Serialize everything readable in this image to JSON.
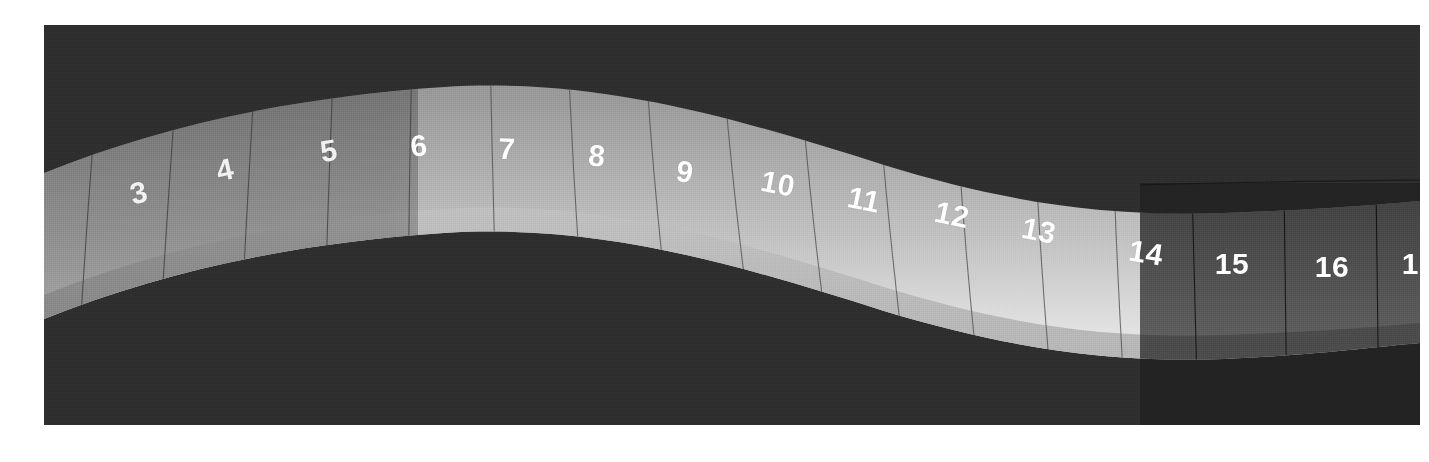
{
  "figure": {
    "background_color": "#ffffff",
    "plate_color": "#2e2e2e",
    "label_color": "#ffffff",
    "zones": [
      {
        "name": "dim-left",
        "x_start": 0,
        "x_end": 374,
        "tint": "#7e7e7e"
      },
      {
        "name": "bright-mid",
        "x_start": 374,
        "x_end": 1096,
        "tint": "#d6d6d6"
      },
      {
        "name": "dark-right",
        "x_start": 1096,
        "x_end": 1376,
        "tint": "#4a4a4a"
      }
    ]
  },
  "chart_data": {
    "type": "bar",
    "subtitle": "",
    "xlabel": "",
    "ylabel": "",
    "grid": false,
    "legend": "none",
    "categories": [
      "3",
      "4",
      "5",
      "6",
      "7",
      "8",
      "9",
      "10",
      "11",
      "12",
      "13",
      "14",
      "15",
      "16",
      "17"
    ],
    "values": [
      3,
      4,
      5,
      6,
      7,
      8,
      9,
      10,
      11,
      12,
      13,
      14,
      15,
      16,
      17
    ],
    "segments": [
      {
        "label": "3",
        "x": 95,
        "y": 168,
        "rotate": -14
      },
      {
        "label": "4",
        "x": 181,
        "y": 145,
        "rotate": -12
      },
      {
        "label": "5",
        "x": 285,
        "y": 126,
        "rotate": -9
      },
      {
        "label": "6",
        "x": 375,
        "y": 121,
        "rotate": -5
      },
      {
        "label": "7",
        "x": 463,
        "y": 124,
        "rotate": 2
      },
      {
        "label": "8",
        "x": 553,
        "y": 131,
        "rotate": 5
      },
      {
        "label": "9",
        "x": 641,
        "y": 147,
        "rotate": 8
      },
      {
        "label": "10",
        "x": 734,
        "y": 159,
        "rotate": 11
      },
      {
        "label": "11",
        "x": 820,
        "y": 175,
        "rotate": 12
      },
      {
        "label": "12",
        "x": 908,
        "y": 190,
        "rotate": 12
      },
      {
        "label": "13",
        "x": 995,
        "y": 206,
        "rotate": 11
      },
      {
        "label": "14",
        "x": 1102,
        "y": 228,
        "rotate": 9
      },
      {
        "label": "15",
        "x": 1188,
        "y": 239,
        "rotate": 0
      },
      {
        "label": "16",
        "x": 1288,
        "y": 242,
        "rotate": 0
      },
      {
        "label": "17",
        "x": 1375,
        "y": 239,
        "rotate": 0
      }
    ],
    "rib_lines_x": [
      56,
      134,
      212,
      290,
      368,
      446,
      524,
      602,
      680,
      758,
      836,
      914,
      992,
      1070,
      1148,
      1240,
      1332
    ],
    "annotations": []
  }
}
